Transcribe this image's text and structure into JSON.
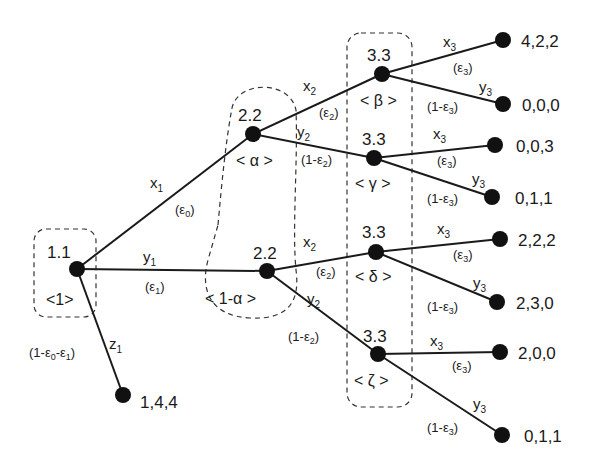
{
  "diagram": {
    "type": "extensive-form game tree",
    "root": {
      "label": "1.1",
      "belief": "<1>"
    },
    "player2_nodes": [
      {
        "label": "2.2",
        "belief": "< α >"
      },
      {
        "label": "2.2",
        "belief": "< 1-α >"
      }
    ],
    "player3_nodes": [
      {
        "label": "3.3",
        "belief": "< β >"
      },
      {
        "label": "3.3",
        "belief": "< γ >"
      },
      {
        "label": "3.3",
        "belief": "< δ >"
      },
      {
        "label": "3.3",
        "belief": "< ζ >"
      }
    ],
    "edges": {
      "x1": {
        "action": "x",
        "sub": "1",
        "prob": "(ε",
        "prob_sub": "0",
        "prob_end": ")"
      },
      "y1": {
        "action": "y",
        "sub": "1",
        "prob": "(ε",
        "prob_sub": "1",
        "prob_end": ")"
      },
      "z1": {
        "action": "z",
        "sub": "1",
        "prob": "(1-ε",
        "prob_sub": "0",
        "prob_mid": "-ε",
        "prob_sub2": "1",
        "prob_end": ")"
      },
      "x2": {
        "action": "x",
        "sub": "2",
        "prob": "(ε",
        "prob_sub": "2",
        "prob_end": ")"
      },
      "y2": {
        "action": "y",
        "sub": "2",
        "prob": "(1-ε",
        "prob_sub": "2",
        "prob_end": ")"
      },
      "x3": {
        "action": "x",
        "sub": "3",
        "prob": "(ε",
        "prob_sub": "3",
        "prob_end": ")"
      },
      "y3": {
        "action": "y",
        "sub": "3",
        "prob": "(1-ε",
        "prob_sub": "3",
        "prob_end": ")"
      }
    },
    "payoffs": [
      "4,2,2",
      "0,0,0",
      "0,0,3",
      "0,1,1",
      "2,2,2",
      "2,3,0",
      "2,0,0",
      "0,1,1",
      "1,4,4"
    ]
  }
}
